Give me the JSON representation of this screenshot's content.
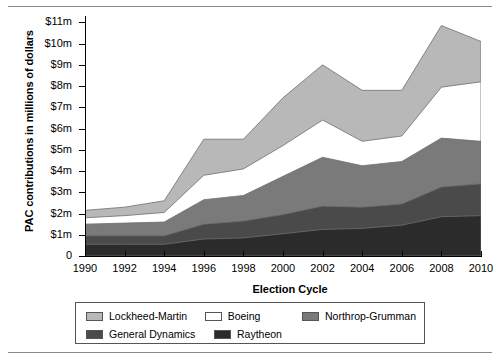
{
  "chart_data": {
    "type": "area",
    "stacked": true,
    "title": "",
    "xlabel": "Election Cycle",
    "ylabel": "PAC contributions in millions of dollars",
    "x": [
      1990,
      1992,
      1994,
      1996,
      1998,
      2000,
      2002,
      2004,
      2006,
      2008,
      2010
    ],
    "xtick_labels": [
      "1990",
      "1992",
      "1994",
      "1996",
      "1998",
      "2000",
      "2002",
      "2004",
      "2006",
      "2008",
      "2010"
    ],
    "ytick_labels": [
      "0",
      "$1m",
      "$2m",
      "$3m",
      "$4m",
      "$5m",
      "$6m",
      "$7m",
      "$8m",
      "$9m",
      "$10m",
      "$11m"
    ],
    "ytick_values": [
      0,
      1,
      2,
      3,
      4,
      5,
      6,
      7,
      8,
      9,
      10,
      11
    ],
    "xlim": [
      1990,
      2010
    ],
    "ylim": [
      0,
      11.3
    ],
    "grid": false,
    "legend_position": "bottom",
    "units": "millions of dollars",
    "series": [
      {
        "name": "Raytheon",
        "color": "#2b2b2b",
        "values": [
          0.55,
          0.55,
          0.55,
          0.8,
          0.85,
          1.05,
          1.25,
          1.3,
          1.45,
          1.85,
          1.9
        ]
      },
      {
        "name": "General Dynamics",
        "color": "#4a4a4a",
        "values": [
          0.95,
          0.95,
          0.95,
          1.5,
          1.65,
          1.95,
          2.35,
          2.3,
          2.45,
          3.25,
          3.4
        ]
      },
      {
        "name": "Northrop-Grumman",
        "color": "#7a7a7a",
        "values": [
          1.5,
          1.55,
          1.6,
          2.65,
          2.85,
          3.75,
          4.65,
          4.25,
          4.45,
          5.55,
          5.4
        ]
      },
      {
        "name": "Boeing",
        "color": "#ffffff",
        "values": [
          1.8,
          1.9,
          2.05,
          3.8,
          4.1,
          5.2,
          6.4,
          5.4,
          5.65,
          7.95,
          8.2
        ]
      },
      {
        "name": "Lockheed-Martin",
        "color": "#b8b8b8",
        "values": [
          2.15,
          2.3,
          2.6,
          5.5,
          5.5,
          7.45,
          9.0,
          7.8,
          7.8,
          10.85,
          10.1
        ]
      }
    ],
    "series_note": "values are cumulative stacked upper boundaries in millions of dollars",
    "legend": [
      {
        "label": "Lockheed-Martin",
        "color": "#b8b8b8"
      },
      {
        "label": "Boeing",
        "color": "#ffffff"
      },
      {
        "label": "Northrop-Grumman",
        "color": "#7a7a7a"
      },
      {
        "label": "General Dynamics",
        "color": "#4a4a4a"
      },
      {
        "label": "Raytheon",
        "color": "#2b2b2b"
      }
    ]
  }
}
